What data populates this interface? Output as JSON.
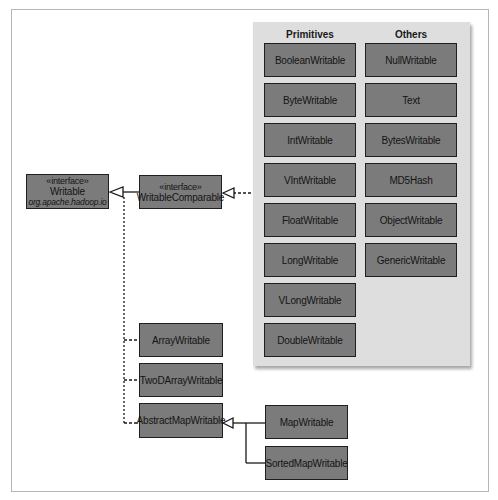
{
  "diagram": {
    "interfaces": {
      "writable": {
        "stereotype": "«interface»",
        "name": "Writable",
        "package": "org.apache.hadoop.io"
      },
      "writable_comparable": {
        "stereotype": "«interface»",
        "name": "WritableComparable"
      }
    },
    "panel": {
      "primitives_header": "Primitives",
      "others_header": "Others",
      "primitives": [
        "BooleanWritable",
        "ByteWritable",
        "IntWritable",
        "VIntWritable",
        "FloatWritable",
        "LongWritable",
        "VLongWritable",
        "DoubleWritable"
      ],
      "others": [
        "NullWritable",
        "Text",
        "BytesWritable",
        "MD5Hash",
        "ObjectWritable",
        "GenericWritable"
      ]
    },
    "writable_impls": [
      "ArrayWritable",
      "TwoDArrayWritable",
      "AbstractMapWritable"
    ],
    "abstract_map_children": [
      "MapWritable",
      "SortedMapWritable"
    ],
    "colors": {
      "box_fill": "#7b7b7b",
      "panel_bg": "#dedede",
      "border": "#1f1f1f",
      "text": "#141414"
    }
  }
}
